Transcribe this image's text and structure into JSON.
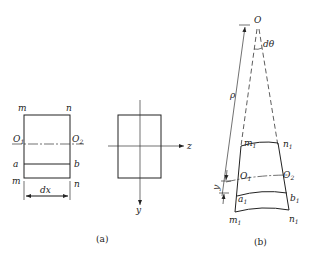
{
  "figure_a": {
    "element_labels": {
      "top_left": "m",
      "top_right": "n",
      "bottom_left": "m",
      "bottom_right": "n",
      "axis_left": "O",
      "axis_left_sub": "1",
      "axis_right": "O",
      "axis_right_sub": "2",
      "fiber_left": "a",
      "fiber_right": "b",
      "width_dim": "dx"
    },
    "cross_section_labels": {
      "z_axis": "z",
      "y_axis": "y"
    },
    "caption": "(a)"
  },
  "figure_b": {
    "center": "O",
    "angle": "dθ",
    "radius": "ρ",
    "labels": {
      "top_left": "m",
      "top_left_sub": "1",
      "top_right": "n",
      "top_right_sub": "1",
      "axis_left": "O",
      "axis_left_sub": "1",
      "axis_right": "O",
      "axis_right_sub": "2",
      "fiber_left": "a",
      "fiber_left_sub": "1",
      "fiber_right": "b",
      "fiber_right_sub": "1",
      "bottom_left": "m",
      "bottom_left_sub": "1",
      "bottom_right": "n",
      "bottom_right_sub": "1",
      "offset": "y"
    },
    "caption": "(b)"
  }
}
